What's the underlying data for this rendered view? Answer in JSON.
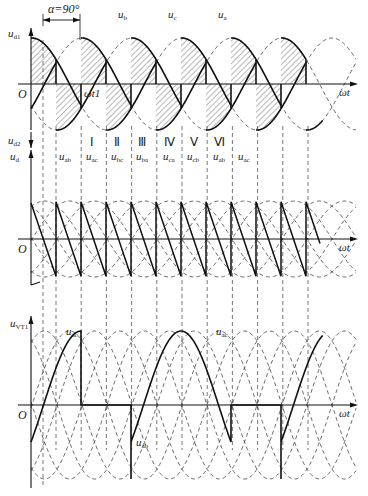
{
  "figure": {
    "alpha_label": "α=90°",
    "origin_label": "O",
    "x_axis_label": "ωt",
    "wt1_label": "ωt1",
    "top_plot": {
      "y_label_main": "u",
      "y_label_sub": "d1",
      "phase_labels": [
        {
          "main": "u",
          "sub": "b",
          "x": 118,
          "y": 8
        },
        {
          "main": "u",
          "sub": "c",
          "x": 168,
          "y": 8
        },
        {
          "main": "u",
          "sub": "a",
          "x": 218,
          "y": 8
        }
      ]
    },
    "middle_plot": {
      "y_label_main": "u",
      "y_label_sub": "d2",
      "y_label2_main": "u",
      "y_label2_sub": "d",
      "interval_numerals": [
        "Ⅰ",
        "Ⅱ",
        "Ⅲ",
        "Ⅳ",
        "Ⅴ",
        "Ⅵ"
      ],
      "line_voltage_labels": [
        {
          "main": "u",
          "sub": "ab"
        },
        {
          "main": "u",
          "sub": "ac"
        },
        {
          "main": "u",
          "sub": "bc"
        },
        {
          "main": "u",
          "sub": "ba"
        },
        {
          "main": "u",
          "sub": "ca"
        },
        {
          "main": "u",
          "sub": "cb"
        },
        {
          "main": "u",
          "sub": "ab"
        },
        {
          "main": "u",
          "sub": "ac"
        }
      ]
    },
    "bottom_plot": {
      "y_label_main": "u",
      "y_label_sub": "VT1",
      "annotations": [
        {
          "main": "u",
          "sub": "ac",
          "x": 66,
          "y": 327
        },
        {
          "main": "u",
          "sub": "ac",
          "x": 216,
          "y": 327
        },
        {
          "main": "u",
          "sub": "ab",
          "x": 136,
          "y": 438
        }
      ]
    }
  },
  "chart_data": {
    "type": "line",
    "xlabel": "ωt",
    "x_units": "degrees",
    "alpha_deg": 90,
    "pixels_per_60deg": 25,
    "origin_x_px": 31,
    "plots": [
      {
        "name": "u_d1",
        "ylabel": "u_d1",
        "description": "Positive-group output voltage with phase voltages ua, ub, uc (dashed); hatched areas show the conducting segments; each segment spans 120° and is equally positive and negative (average zero).",
        "series": [
          "u_a",
          "u_b",
          "u_c"
        ],
        "zero_y_px": 84,
        "amplitude_px": 46
      },
      {
        "name": "u_d",
        "ylabel": "u_d2 / u_d",
        "description": "Output voltage u_d composed of line-voltage segments; sawtooth from +peak·sin(60°) down to −peak·sin(60°) every 60°.",
        "intervals": [
          "I",
          "II",
          "III",
          "IV",
          "V",
          "VI"
        ],
        "segment_voltages": [
          "u_ab",
          "u_ac",
          "u_bc",
          "u_ba",
          "u_ca",
          "u_cb",
          "u_ab",
          "u_ac"
        ],
        "zero_y_px": 239,
        "amplitude_px": 38
      },
      {
        "name": "u_VT1",
        "ylabel": "u_VT1",
        "description": "Voltage across thyristor VT1: zero during conduction (120°), then u_ab and u_ac segments.",
        "segments": [
          "u_ac",
          "0",
          "u_ab",
          "u_ac"
        ],
        "zero_y_px": 405,
        "amplitude_px": 74
      }
    ]
  }
}
